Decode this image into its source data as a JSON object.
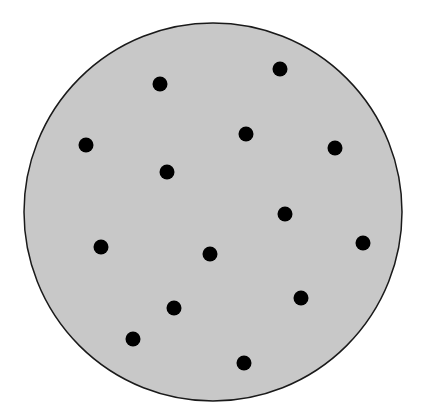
{
  "diagram": {
    "type": "dot-distribution",
    "width": 425,
    "height": 416,
    "background": "#ffffff",
    "circle": {
      "cx": 213,
      "cy": 212,
      "r": 189,
      "fill": "#c8c8c8",
      "stroke": "#1a1a1a",
      "stroke_width": 1.5
    },
    "dot_radius": 7.5,
    "dot_color": "#000000",
    "dots": [
      {
        "x": 160,
        "y": 84
      },
      {
        "x": 280,
        "y": 69
      },
      {
        "x": 86,
        "y": 145
      },
      {
        "x": 246,
        "y": 134
      },
      {
        "x": 335,
        "y": 148
      },
      {
        "x": 167,
        "y": 172
      },
      {
        "x": 285,
        "y": 214
      },
      {
        "x": 101,
        "y": 247
      },
      {
        "x": 210,
        "y": 254
      },
      {
        "x": 363,
        "y": 243
      },
      {
        "x": 174,
        "y": 308
      },
      {
        "x": 301,
        "y": 298
      },
      {
        "x": 133,
        "y": 339
      },
      {
        "x": 244,
        "y": 363
      }
    ]
  }
}
